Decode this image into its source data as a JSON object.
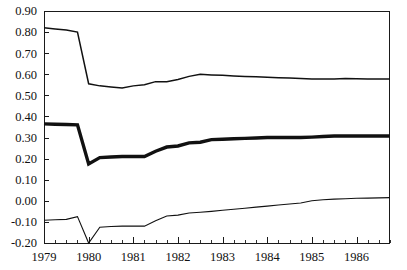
{
  "chart_data": {
    "type": "line",
    "title": "",
    "subtitle": "",
    "xlabel": "",
    "ylabel": "",
    "grid": false,
    "legend_position": "none",
    "xlim": [
      1979.0,
      1986.75
    ],
    "ylim": [
      -0.2,
      0.9
    ],
    "y_ticks": [
      -0.2,
      -0.1,
      0.0,
      0.1,
      0.2,
      0.3,
      0.4,
      0.5,
      0.6,
      0.7,
      0.8,
      0.9
    ],
    "y_tick_labels": [
      "-0.20",
      "-0.10",
      "0.00",
      "0.10",
      "0.20",
      "0.30",
      "0.40",
      "0.50",
      "0.60",
      "0.70",
      "0.80",
      "0.90"
    ],
    "x_ticks": [
      1979,
      1980,
      1981,
      1982,
      1983,
      1984,
      1985,
      1986
    ],
    "x_tick_labels": [
      "1979",
      "1980",
      "1981",
      "1982",
      "1983",
      "1984",
      "1985",
      "1986"
    ],
    "x_minor_interval": 0.25,
    "x": [
      1979.0,
      1979.25,
      1979.5,
      1979.75,
      1980.0,
      1980.25,
      1980.5,
      1980.75,
      1981.0,
      1981.25,
      1981.5,
      1981.75,
      1982.0,
      1982.25,
      1982.5,
      1982.75,
      1983.0,
      1983.25,
      1983.5,
      1983.75,
      1984.0,
      1984.25,
      1984.5,
      1984.75,
      1985.0,
      1985.25,
      1985.5,
      1985.75,
      1986.0,
      1986.25,
      1986.5,
      1986.75
    ],
    "series": [
      {
        "name": "upper-band",
        "style": "thin",
        "color": "#111111",
        "values": [
          0.82,
          0.815,
          0.81,
          0.8,
          0.555,
          0.545,
          0.54,
          0.535,
          0.545,
          0.55,
          0.565,
          0.565,
          0.575,
          0.59,
          0.6,
          0.597,
          0.595,
          0.592,
          0.59,
          0.588,
          0.586,
          0.584,
          0.582,
          0.58,
          0.578,
          0.577,
          0.578,
          0.58,
          0.579,
          0.578,
          0.578,
          0.578
        ]
      },
      {
        "name": "center-estimate",
        "style": "bold",
        "color": "#111111",
        "values": [
          0.365,
          0.363,
          0.362,
          0.36,
          0.175,
          0.205,
          0.208,
          0.21,
          0.21,
          0.21,
          0.235,
          0.255,
          0.26,
          0.275,
          0.278,
          0.29,
          0.292,
          0.294,
          0.296,
          0.298,
          0.3,
          0.3,
          0.3,
          0.3,
          0.302,
          0.305,
          0.307,
          0.307,
          0.307,
          0.307,
          0.307,
          0.307
        ]
      },
      {
        "name": "lower-band",
        "style": "hair",
        "color": "#111111",
        "values": [
          -0.092,
          -0.09,
          -0.088,
          -0.075,
          -0.2,
          -0.125,
          -0.122,
          -0.12,
          -0.12,
          -0.12,
          -0.095,
          -0.072,
          -0.068,
          -0.058,
          -0.054,
          -0.05,
          -0.045,
          -0.04,
          -0.035,
          -0.03,
          -0.025,
          -0.02,
          -0.015,
          -0.01,
          0.0,
          0.005,
          0.008,
          0.01,
          0.012,
          0.013,
          0.014,
          0.015
        ]
      }
    ]
  },
  "plot_geometry": {
    "left": 44,
    "right": 390,
    "top": 11,
    "bottom": 243
  }
}
